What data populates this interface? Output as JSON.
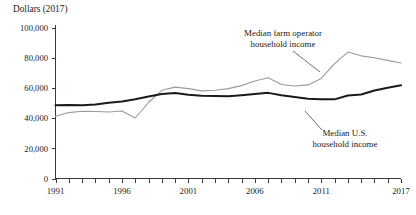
{
  "chart_data": {
    "type": "line",
    "title": "",
    "ylabel": "Dollars (2017)",
    "xlabel": "",
    "ylim": [
      0,
      100000
    ],
    "xlim": [
      1991,
      2017
    ],
    "grid": false,
    "legend_position": "inline-annotations",
    "ytick_labels": [
      "0",
      "20,000",
      "40,000",
      "60,000",
      "80,000",
      "100,000"
    ],
    "ytick_values": [
      0,
      20000,
      40000,
      60000,
      80000,
      100000
    ],
    "xtick_labels": [
      "1991",
      "1996",
      "2001",
      "2006",
      "2011",
      "2017"
    ],
    "xtick_values": [
      1991,
      1996,
      2001,
      2006,
      2011,
      2017
    ],
    "x": [
      1991,
      1992,
      1993,
      1994,
      1995,
      1996,
      1997,
      1998,
      1999,
      2000,
      2001,
      2002,
      2003,
      2004,
      2005,
      2006,
      2007,
      2008,
      2009,
      2010,
      2011,
      2012,
      2013,
      2014,
      2015,
      2016,
      2017
    ],
    "series": [
      {
        "name": "Median farm operator household income",
        "color": "#9a9a9a",
        "values": [
          41300,
          43800,
          44700,
          44500,
          44200,
          44900,
          40200,
          50500,
          58600,
          60700,
          59700,
          58200,
          58600,
          59700,
          61700,
          64800,
          67000,
          62500,
          61500,
          62200,
          66500,
          76300,
          84000,
          81500,
          80200,
          78500,
          76700
        ]
      },
      {
        "name": "Median U.S. household income",
        "color": "#1a1a1a",
        "values": [
          48700,
          48800,
          48700,
          49200,
          50400,
          51200,
          52600,
          54500,
          56200,
          56800,
          55600,
          55000,
          54900,
          54700,
          55300,
          56100,
          56900,
          55300,
          54100,
          53000,
          52700,
          52600,
          55200,
          55800,
          58500,
          60300,
          61900
        ]
      }
    ],
    "annotations": [
      {
        "name": "farm-operator-annotation",
        "text_line1": "Median farm operator",
        "text_line2": "household income",
        "text_x": 283,
        "text_y1": 36,
        "text_y2": 47,
        "leader_x1": 293,
        "leader_y1": 51,
        "leader_x2": 320,
        "leader_y2": 72
      },
      {
        "name": "us-household-annotation",
        "text_line1": "Median U.S.",
        "text_line2": "household income",
        "text_x": 345,
        "text_y1": 136,
        "text_y2": 147,
        "leader_x1": 322,
        "leader_y1": 130,
        "leader_x2": 305,
        "leader_y2": 111
      }
    ]
  },
  "colors": {
    "background": "#ffffff",
    "axis": "#3a3a3a",
    "text": "#1a1a1a",
    "series_farm": "#9a9a9a",
    "series_us": "#1a1a1a"
  }
}
